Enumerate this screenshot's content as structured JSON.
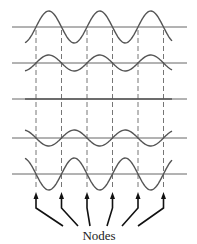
{
  "diagram": {
    "caption": "Nodes",
    "colors": {
      "wave": "#555555",
      "axis": "#666666",
      "dashed": "#666666",
      "arrow": "#111111",
      "text": "#222222"
    },
    "axis_x_start": 12,
    "axis_x_end": 187,
    "wave_x_start": 25,
    "wave_x_end": 172,
    "half_wavelength": 25.5,
    "node_positions": [
      36,
      61.5,
      87,
      112.5,
      138,
      163.5
    ],
    "snapshots": [
      {
        "baseline_y": 27,
        "amplitude": 16
      },
      {
        "baseline_y": 63,
        "amplitude": 8
      },
      {
        "baseline_y": 99,
        "amplitude": 0
      },
      {
        "baseline_y": 138,
        "amplitude": -8
      },
      {
        "baseline_y": 174,
        "amplitude": -16
      }
    ],
    "arrows": [
      {
        "tip_x": 36,
        "end_x": 63
      },
      {
        "tip_x": 61.5,
        "end_x": 78
      },
      {
        "tip_x": 87,
        "end_x": 90
      },
      {
        "tip_x": 112.5,
        "end_x": 107
      },
      {
        "tip_x": 138,
        "end_x": 122
      },
      {
        "tip_x": 163.5,
        "end_x": 138
      }
    ]
  }
}
